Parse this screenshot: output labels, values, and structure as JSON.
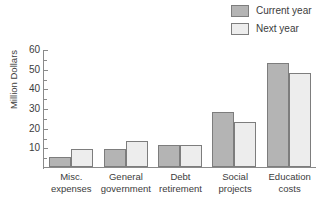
{
  "chart_data": {
    "type": "bar",
    "title": "",
    "xlabel": "",
    "ylabel": "Million Dollars",
    "ylim": [
      0,
      60
    ],
    "ytick_labels": [
      "10",
      "20",
      "30",
      "40",
      "50",
      "60"
    ],
    "ytick_values": [
      10,
      20,
      30,
      40,
      50,
      60
    ],
    "yminor_values": [
      5,
      15,
      25,
      35,
      45,
      55
    ],
    "grid": false,
    "legend_position": "top-right",
    "categories": [
      "Misc. expenses",
      "General government",
      "Debt retirement",
      "Social projects",
      "Education costs"
    ],
    "category_lines": [
      [
        "Misc.",
        "expenses"
      ],
      [
        "General",
        "government"
      ],
      [
        "Debt",
        "retirement"
      ],
      [
        "Social",
        "projects"
      ],
      [
        "Education",
        "costs"
      ]
    ],
    "series": [
      {
        "name": "Current year",
        "color": "#b4b4b4",
        "values": [
          5,
          9,
          11,
          28,
          53
        ]
      },
      {
        "name": "Next year",
        "color": "#ededed",
        "values": [
          9,
          13,
          11,
          23,
          48
        ]
      }
    ]
  },
  "legend": {
    "items": [
      {
        "label": "Current year",
        "swatch": "#b4b4b4"
      },
      {
        "label": "Next year",
        "swatch": "#ededed"
      }
    ]
  },
  "axis": {
    "y_title": "Million Dollars"
  },
  "colors": {
    "series_current": "#b4b4b4",
    "series_next": "#ededed",
    "bar_border": "#7d7d7d",
    "axis_line": "#8a8a8a",
    "text": "#3c3c3c"
  }
}
